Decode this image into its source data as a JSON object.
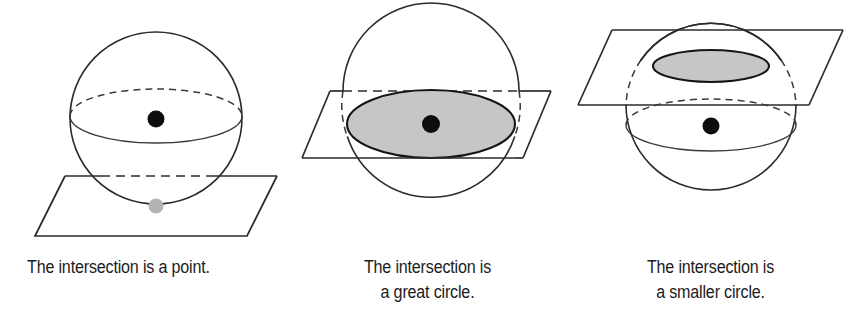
{
  "figure": {
    "background_color": "#ffffff",
    "stroke_color": "#2b2b2b",
    "shaded_fill_color": "#c6c6c6",
    "center_dot_color": "#0d0d0d",
    "tangent_dot_color": "#b4b4b4"
  },
  "panels": [
    {
      "id": "tangent-plane",
      "caption": "The intersection is a point.",
      "caption_lines": [
        "The intersection is a point."
      ],
      "intersection_type": "point",
      "plane_position": "tangent at the bottom of the sphere",
      "markers": [
        "sphere-center-dot",
        "tangent-point-dot"
      ]
    },
    {
      "id": "great-circle-plane",
      "caption": "The intersection is\na great circle.",
      "caption_lines": [
        "The intersection is",
        "a great circle."
      ],
      "intersection_type": "great circle",
      "plane_position": "through the center of the sphere",
      "markers": [
        "sphere-center-dot",
        "shaded-great-circle-disc"
      ]
    },
    {
      "id": "smaller-circle-plane",
      "caption": "The intersection is\na smaller circle.",
      "caption_lines": [
        "The intersection is",
        "a smaller circle."
      ],
      "intersection_type": "smaller circle",
      "plane_position": "above the center of the sphere",
      "markers": [
        "sphere-center-dot",
        "shaded-smaller-circle-disc"
      ]
    }
  ]
}
